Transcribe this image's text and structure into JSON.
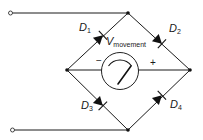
{
  "diagram": {
    "type": "bridge-rectifier-meter-circuit",
    "colors": {
      "line": "#1a1a1a",
      "background": "#ffffff"
    },
    "diodes": [
      {
        "id": "D1",
        "label": "D",
        "subscript": "1",
        "position": "upper-left"
      },
      {
        "id": "D2",
        "label": "D",
        "subscript": "2",
        "position": "upper-right"
      },
      {
        "id": "D3",
        "label": "D",
        "subscript": "3",
        "position": "lower-left"
      },
      {
        "id": "D4",
        "label": "D",
        "subscript": "4",
        "position": "lower-right"
      }
    ],
    "meter": {
      "label": "V",
      "subscript": "movement",
      "negative_sign": "−",
      "positive_sign": "+"
    },
    "terminals": [
      {
        "id": "input-top",
        "position": "top-left"
      },
      {
        "id": "input-bottom",
        "position": "bottom-left"
      }
    ]
  }
}
